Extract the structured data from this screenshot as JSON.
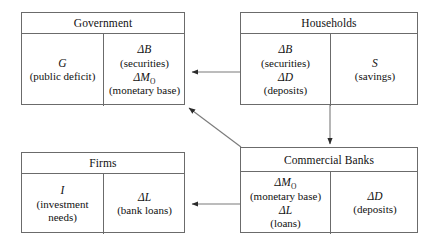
{
  "diagram": {
    "line_color": "#6b6b6b",
    "arrow_color": "#4a4a4a",
    "text_color": "#111111",
    "boxes": [
      {
        "id": "government",
        "header": "Government",
        "cells": [
          {
            "id": "gov-left",
            "entries": [
              {
                "term": "G",
                "gloss": "(public deficit)"
              }
            ]
          },
          {
            "id": "gov-right",
            "entries": [
              {
                "term": "ΔB",
                "gloss": "(securities)"
              },
              {
                "term": "ΔM",
                "term_sub": "O",
                "gloss": "(monetary base)"
              }
            ]
          }
        ]
      },
      {
        "id": "households",
        "header": "Households",
        "cells": [
          {
            "id": "hh-left",
            "entries": [
              {
                "term": "ΔB",
                "gloss": "(securities)"
              },
              {
                "term": "ΔD",
                "gloss": "(deposits)"
              }
            ]
          },
          {
            "id": "hh-right",
            "entries": [
              {
                "term": "S",
                "gloss": "(savings)"
              }
            ]
          }
        ]
      },
      {
        "id": "firms",
        "header": "Firms",
        "cells": [
          {
            "id": "firms-left",
            "entries": [
              {
                "term": "I",
                "gloss": "(investment needs)"
              }
            ]
          },
          {
            "id": "firms-right",
            "entries": [
              {
                "term": "ΔL",
                "gloss": "(bank loans)"
              }
            ]
          }
        ]
      },
      {
        "id": "commercial-banks",
        "header": "Commercial Banks",
        "cells": [
          {
            "id": "cb-left",
            "entries": [
              {
                "term": "ΔM",
                "term_sub": "O",
                "gloss": "(monetary base)"
              },
              {
                "term": "ΔL",
                "gloss": "(loans)"
              }
            ]
          },
          {
            "id": "cb-right",
            "entries": [
              {
                "term": "ΔD",
                "gloss": "(deposits)"
              }
            ]
          }
        ]
      }
    ],
    "arrows": [
      {
        "id": "households-to-government",
        "from": "households",
        "to": "government",
        "direction": "left"
      },
      {
        "id": "households-to-commercial-banks",
        "from": "households",
        "to": "commercial-banks",
        "direction": "down"
      },
      {
        "id": "commercial-banks-to-government",
        "from": "commercial-banks",
        "to": "government",
        "direction": "up-left"
      },
      {
        "id": "commercial-banks-to-firms",
        "from": "commercial-banks",
        "to": "firms",
        "direction": "left"
      }
    ]
  }
}
